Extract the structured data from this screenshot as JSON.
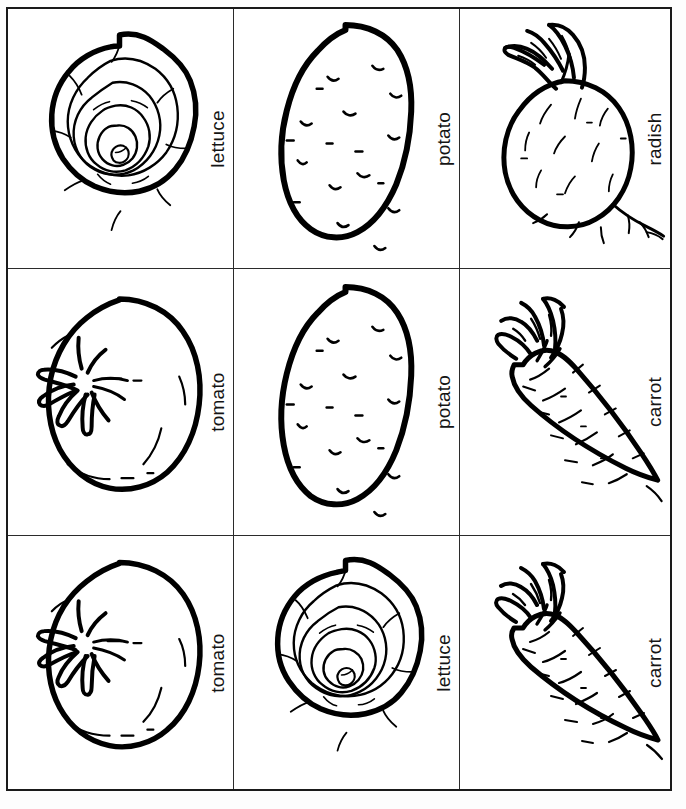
{
  "sheet": {
    "title": "Vegetable picture cards",
    "background_color": "#fdfdfd",
    "border_color": "#1a1a1a",
    "ink_color": "#000000",
    "columns": 3,
    "rows": 3
  },
  "cards": [
    {
      "label": "lettuce",
      "art": "lettuce-illustration",
      "row": 1,
      "column": 1
    },
    {
      "label": "potato",
      "art": "potato-illustration",
      "row": 1,
      "column": 2
    },
    {
      "label": "radish",
      "art": "radish-illustration",
      "row": 1,
      "column": 3
    },
    {
      "label": "tomato",
      "art": "tomato-illustration",
      "row": 2,
      "column": 1
    },
    {
      "label": "potato",
      "art": "potato-illustration",
      "row": 2,
      "column": 2
    },
    {
      "label": "carrot",
      "art": "carrot-illustration",
      "row": 2,
      "column": 3
    },
    {
      "label": "tomato",
      "art": "tomato-illustration",
      "row": 3,
      "column": 1
    },
    {
      "label": "lettuce",
      "art": "lettuce-illustration",
      "row": 3,
      "column": 2
    },
    {
      "label": "carrot",
      "art": "carrot-illustration",
      "row": 3,
      "column": 3
    }
  ]
}
